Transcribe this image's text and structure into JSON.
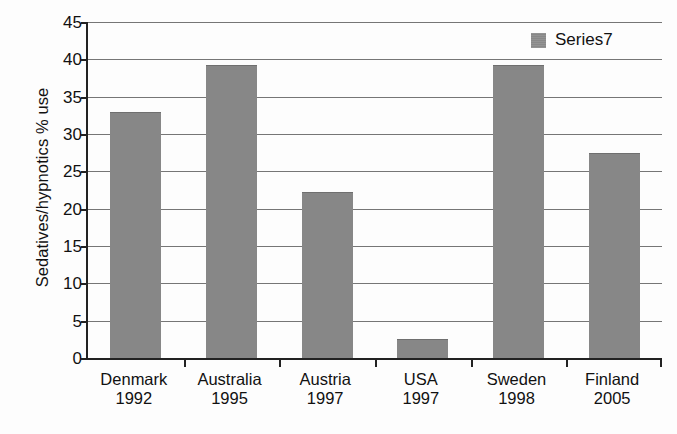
{
  "chart_data": {
    "type": "bar",
    "title": "",
    "xlabel": "",
    "ylabel": "Sedatives/hypnotics % use",
    "ylim": [
      0,
      45
    ],
    "ytick_step": 5,
    "yticks": [
      0,
      5,
      10,
      15,
      20,
      25,
      30,
      35,
      40,
      45
    ],
    "ytick_labels": [
      "0",
      "5",
      "10",
      "15",
      "20",
      "25",
      "30",
      "35",
      "40",
      "45"
    ],
    "grid": true,
    "legend_position": "top-right",
    "legend": [
      "Series7"
    ],
    "categories": [
      "Denmark 1992",
      "Australia 1995",
      "Austria 1997",
      "USA 1997",
      "Sweden 1998",
      "Finland 2005"
    ],
    "category_parts": [
      {
        "country": "Denmark",
        "year": "1992"
      },
      {
        "country": "Australia",
        "year": "1995"
      },
      {
        "country": "Austria",
        "year": "1997"
      },
      {
        "country": "USA",
        "year": "1997"
      },
      {
        "country": "Sweden",
        "year": "1998"
      },
      {
        "country": "Finland",
        "year": "2005"
      }
    ],
    "series": [
      {
        "name": "Series7",
        "color": "#878787",
        "values": [
          33.0,
          39.3,
          22.2,
          2.6,
          39.3,
          27.4
        ]
      }
    ]
  },
  "legend": {
    "series7_label": "Series7",
    "swatch_color": "#8c8c8c"
  },
  "axes": {
    "y_title": "Sedatives/hypnotics % use"
  }
}
